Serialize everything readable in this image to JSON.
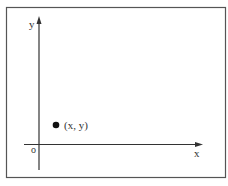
{
  "diagram": {
    "type": "cartesian-plane",
    "axes": {
      "x_label": "x",
      "y_label": "y",
      "origin_label": "o"
    },
    "point": {
      "label": "(x, y)"
    },
    "colors": {
      "line": "#333333",
      "frame": "#555555",
      "background": "#ffffff"
    }
  }
}
